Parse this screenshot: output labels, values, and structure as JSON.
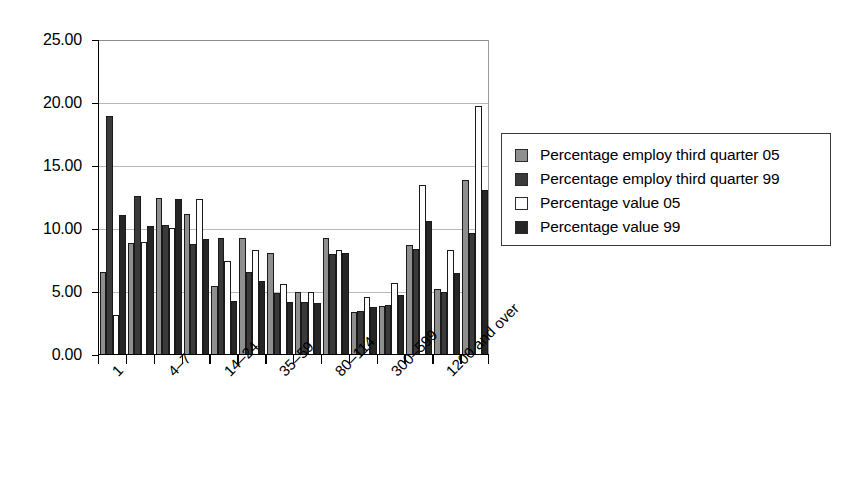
{
  "chart_data": {
    "type": "bar",
    "title": "",
    "subtitle": "",
    "xlabel": "",
    "ylabel": "",
    "ylim": [
      0,
      25
    ],
    "ytick_values": [
      0,
      5,
      10,
      15,
      20,
      25
    ],
    "ytick_labels": [
      "0.00",
      "5.00",
      "10.00",
      "15.00",
      "20.00",
      "25.00"
    ],
    "grid": true,
    "grid_axis": "y",
    "legend_position": "right",
    "bar_layout": "grouped",
    "categories": [
      "1",
      "2-3",
      "4-7",
      "8-13",
      "14-24",
      "25-34",
      "35-59",
      "60-79",
      "80-114",
      "115-299",
      "300-599",
      "600-1199",
      "1200 and over",
      ""
    ],
    "xtick_labels_shown": [
      "1",
      "4-7",
      "14-24",
      "35-59",
      "80-114",
      "300-599",
      "1200 and over"
    ],
    "xtick_labels_display": [
      "1",
      "4–7",
      "14–24",
      "35–59",
      "80–114",
      "300–599",
      "1200 and over"
    ],
    "xtick_label_rotation": -45,
    "series": [
      {
        "name": "Percentage employ third quarter 05",
        "color": "#8f8f8f",
        "values": [
          6.6,
          8.9,
          12.5,
          11.2,
          5.5,
          9.3,
          8.1,
          5.0,
          9.3,
          3.4,
          3.9,
          8.7,
          5.2,
          13.9
        ]
      },
      {
        "name": "Percentage employ third quarter 99",
        "color": "#3a3a3a",
        "values": [
          19.0,
          12.6,
          10.3,
          8.8,
          9.3,
          6.6,
          4.9,
          4.2,
          8.0,
          3.5,
          4.0,
          8.4,
          5.0,
          9.7
        ]
      },
      {
        "name": "Percentage value 05",
        "color": "#fdfdfd",
        "values": [
          3.2,
          9.0,
          10.1,
          12.4,
          7.5,
          8.3,
          5.6,
          5.0,
          8.3,
          4.6,
          5.7,
          13.5,
          8.3,
          19.8
        ]
      },
      {
        "name": "Percentage value 99",
        "color": "#262626",
        "values": [
          11.1,
          10.2,
          12.4,
          9.2,
          4.3,
          5.9,
          4.2,
          4.1,
          8.1,
          3.8,
          4.8,
          10.6,
          6.5,
          13.1
        ]
      }
    ]
  },
  "legend": {
    "items": [
      {
        "label": "Percentage employ third quarter 05",
        "swatch": "legend-swatch-series-0"
      },
      {
        "label": "Percentage employ third quarter 99",
        "swatch": "legend-swatch-series-1"
      },
      {
        "label": "Percentage value 05",
        "swatch": "legend-swatch-series-2"
      },
      {
        "label": "Percentage value 99",
        "swatch": "legend-swatch-series-3"
      }
    ]
  }
}
